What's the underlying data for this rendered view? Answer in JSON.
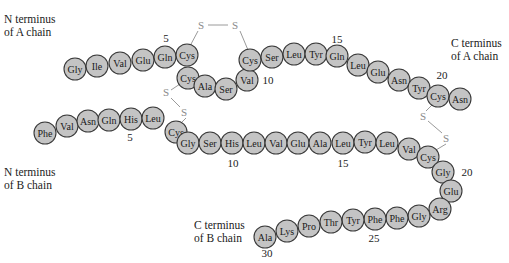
{
  "colors": {
    "residue_fill": "#c4c4c4",
    "residue_stroke": "#3a3a3a",
    "disulfide": "#9a9a9a"
  },
  "labels": {
    "n_term_a": [
      "N terminus",
      "of A chain"
    ],
    "c_term_a": [
      "C terminus",
      "of A chain"
    ],
    "n_term_b": [
      "N terminus",
      "of B chain"
    ],
    "c_term_b": [
      "C terminus",
      "of B chain"
    ]
  },
  "chain_a": [
    {
      "n": 1,
      "aa": "Gly",
      "x": 75,
      "y": 69
    },
    {
      "n": 2,
      "aa": "Ile",
      "x": 97,
      "y": 66
    },
    {
      "n": 3,
      "aa": "Val",
      "x": 120,
      "y": 63
    },
    {
      "n": 4,
      "aa": "Glu",
      "x": 143,
      "y": 60
    },
    {
      "n": 5,
      "aa": "Gln",
      "x": 165,
      "y": 57
    },
    {
      "n": 6,
      "aa": "Cys",
      "x": 187,
      "y": 55
    },
    {
      "n": 7,
      "aa": "Cys",
      "x": 188,
      "y": 78
    },
    {
      "n": 8,
      "aa": "Ala",
      "x": 205,
      "y": 86
    },
    {
      "n": 9,
      "aa": "Ser",
      "x": 226,
      "y": 89
    },
    {
      "n": 10,
      "aa": "Val",
      "x": 247,
      "y": 80
    },
    {
      "n": 11,
      "aa": "Cys",
      "x": 250,
      "y": 60
    },
    {
      "n": 12,
      "aa": "Ser",
      "x": 272,
      "y": 57
    },
    {
      "n": 13,
      "aa": "Leu",
      "x": 294,
      "y": 54
    },
    {
      "n": 14,
      "aa": "Tyr",
      "x": 316,
      "y": 54
    },
    {
      "n": 15,
      "aa": "Gln",
      "x": 337,
      "y": 56
    },
    {
      "n": 16,
      "aa": "Leu",
      "x": 358,
      "y": 65
    },
    {
      "n": 17,
      "aa": "Glu",
      "x": 378,
      "y": 72
    },
    {
      "n": 18,
      "aa": "Asn",
      "x": 399,
      "y": 80
    },
    {
      "n": 19,
      "aa": "Tyr",
      "x": 419,
      "y": 88
    },
    {
      "n": 20,
      "aa": "Cys",
      "x": 438,
      "y": 96
    },
    {
      "n": 21,
      "aa": "Asn",
      "x": 460,
      "y": 99
    }
  ],
  "chain_b": [
    {
      "n": 1,
      "aa": "Phe",
      "x": 45,
      "y": 133
    },
    {
      "n": 2,
      "aa": "Val",
      "x": 67,
      "y": 126
    },
    {
      "n": 3,
      "aa": "Asn",
      "x": 88,
      "y": 121
    },
    {
      "n": 4,
      "aa": "Gln",
      "x": 109,
      "y": 120
    },
    {
      "n": 5,
      "aa": "His",
      "x": 131,
      "y": 119
    },
    {
      "n": 6,
      "aa": "Leu",
      "x": 153,
      "y": 118
    },
    {
      "n": 7,
      "aa": "Cys",
      "x": 176,
      "y": 132
    },
    {
      "n": 8,
      "aa": "Gly",
      "x": 188,
      "y": 143
    },
    {
      "n": 9,
      "aa": "Ser",
      "x": 210,
      "y": 143
    },
    {
      "n": 10,
      "aa": "His",
      "x": 232,
      "y": 143
    },
    {
      "n": 11,
      "aa": "Leu",
      "x": 254,
      "y": 143
    },
    {
      "n": 12,
      "aa": "Val",
      "x": 276,
      "y": 143
    },
    {
      "n": 13,
      "aa": "Glu",
      "x": 298,
      "y": 143
    },
    {
      "n": 14,
      "aa": "Ala",
      "x": 320,
      "y": 143
    },
    {
      "n": 15,
      "aa": "Leu",
      "x": 343,
      "y": 143
    },
    {
      "n": 16,
      "aa": "Tyr",
      "x": 365,
      "y": 142
    },
    {
      "n": 17,
      "aa": "Leu",
      "x": 387,
      "y": 143
    },
    {
      "n": 18,
      "aa": "Val",
      "x": 409,
      "y": 149
    },
    {
      "n": 19,
      "aa": "Cys",
      "x": 428,
      "y": 157
    },
    {
      "n": 20,
      "aa": "Gly",
      "x": 443,
      "y": 172
    },
    {
      "n": 21,
      "aa": "Glu",
      "x": 451,
      "y": 191
    },
    {
      "n": 22,
      "aa": "Arg",
      "x": 440,
      "y": 209
    },
    {
      "n": 23,
      "aa": "Gly",
      "x": 419,
      "y": 216
    },
    {
      "n": 24,
      "aa": "Phe",
      "x": 397,
      "y": 218
    },
    {
      "n": 25,
      "aa": "Phe",
      "x": 375,
      "y": 219
    },
    {
      "n": 26,
      "aa": "Tyr",
      "x": 353,
      "y": 220
    },
    {
      "n": 27,
      "aa": "Thr",
      "x": 331,
      "y": 222
    },
    {
      "n": 28,
      "aa": "Pro",
      "x": 309,
      "y": 226
    },
    {
      "n": 29,
      "aa": "Lys",
      "x": 287,
      "y": 231
    },
    {
      "n": 30,
      "aa": "Ala",
      "x": 265,
      "y": 237
    }
  ],
  "position_numbers": [
    {
      "text": "5",
      "x": 166,
      "y": 38
    },
    {
      "text": "10",
      "x": 268,
      "y": 80
    },
    {
      "text": "15",
      "x": 337,
      "y": 39
    },
    {
      "text": "20",
      "x": 442,
      "y": 75
    },
    {
      "text": "5",
      "x": 130,
      "y": 137
    },
    {
      "text": "10",
      "x": 233,
      "y": 163
    },
    {
      "text": "15",
      "x": 343,
      "y": 163
    },
    {
      "text": "20",
      "x": 467,
      "y": 172
    },
    {
      "text": "25",
      "x": 374,
      "y": 238
    },
    {
      "text": "30",
      "x": 267,
      "y": 253
    }
  ],
  "disulfide_bonds": [
    {
      "name": "A6-A11",
      "sulfurs": [
        {
          "text": "S",
          "x": 201,
          "y": 25
        },
        {
          "text": "S",
          "x": 235,
          "y": 25
        }
      ],
      "path": [
        [
          190,
          46
        ],
        [
          198,
          31
        ],
        [
          208,
          25
        ],
        [
          228,
          25
        ],
        [
          240,
          31
        ],
        [
          248,
          50
        ]
      ]
    },
    {
      "name": "A7-B7",
      "sulfurs": [
        {
          "text": "S",
          "x": 166,
          "y": 92
        },
        {
          "text": "S",
          "x": 184,
          "y": 112
        }
      ],
      "path": [
        [
          180,
          84
        ],
        [
          171,
          90
        ],
        [
          171,
          98
        ],
        [
          180,
          107
        ],
        [
          186,
          118
        ],
        [
          180,
          124
        ]
      ]
    },
    {
      "name": "A20-B19",
      "sulfurs": [
        {
          "text": "S",
          "x": 423,
          "y": 116
        },
        {
          "text": "S",
          "x": 446,
          "y": 138
        }
      ],
      "path": [
        [
          432,
          105
        ],
        [
          426,
          111
        ],
        [
          428,
          121
        ],
        [
          442,
          133
        ],
        [
          446,
          144
        ],
        [
          436,
          150
        ]
      ]
    }
  ]
}
